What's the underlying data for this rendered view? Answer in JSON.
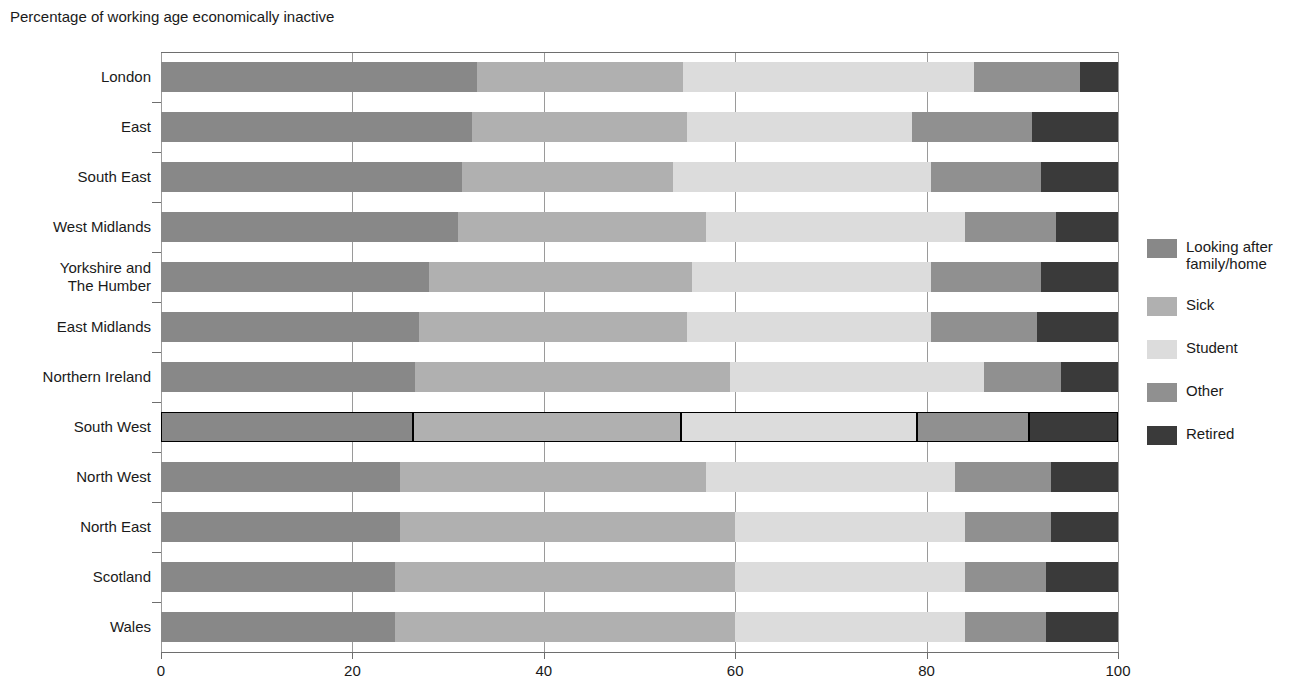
{
  "chart_data": {
    "type": "bar",
    "orientation": "horizontal",
    "stacked": true,
    "normalized": true,
    "title": "Percentage of working age economically inactive",
    "xlabel": "",
    "ylabel": "",
    "xlim": [
      0,
      100
    ],
    "xticks": [
      0,
      20,
      40,
      60,
      80,
      100
    ],
    "xtick_labels": [
      "0",
      "20",
      "40",
      "60",
      "80",
      "100"
    ],
    "grid": true,
    "legend_position": "right",
    "highlighted_category": "South West",
    "categories": [
      "London",
      "East",
      "South East",
      "West Midlands",
      "Yorkshire and\nThe Humber",
      "East Midlands",
      "Northern Ireland",
      "South West",
      "North West",
      "North East",
      "Scotland",
      "Wales"
    ],
    "series": [
      {
        "name": "Looking after\nfamily/home",
        "color": "#888888",
        "values": [
          33.0,
          32.5,
          31.5,
          31.0,
          28.0,
          27.0,
          26.5,
          26.3,
          25.0,
          25.0,
          24.5,
          24.5
        ]
      },
      {
        "name": "Sick",
        "color": "#b0b0b0",
        "values": [
          21.5,
          22.5,
          22.0,
          26.0,
          27.5,
          28.0,
          33.0,
          28.0,
          32.0,
          35.0,
          35.5,
          35.5
        ]
      },
      {
        "name": "Student",
        "color": "#dcdcdc",
        "values": [
          30.5,
          23.5,
          27.0,
          27.0,
          25.0,
          25.5,
          26.5,
          24.7,
          26.0,
          24.0,
          24.0,
          24.0
        ]
      },
      {
        "name": "Other",
        "color": "#909090",
        "values": [
          11.0,
          12.5,
          11.5,
          9.5,
          11.5,
          11.0,
          8.0,
          11.7,
          10.0,
          9.0,
          8.5,
          8.5
        ]
      },
      {
        "name": "Retired",
        "color": "#3a3a3a",
        "values": [
          4.0,
          9.0,
          8.0,
          6.5,
          8.0,
          8.5,
          6.0,
          9.3,
          7.0,
          7.0,
          7.5,
          7.5
        ]
      }
    ]
  },
  "legend": {
    "items": [
      {
        "label": "Looking after\nfamily/home",
        "color": "#888888"
      },
      {
        "label": "Sick",
        "color": "#b0b0b0"
      },
      {
        "label": "Student",
        "color": "#dcdcdc"
      },
      {
        "label": "Other",
        "color": "#909090"
      },
      {
        "label": "Retired",
        "color": "#3a3a3a"
      }
    ]
  }
}
